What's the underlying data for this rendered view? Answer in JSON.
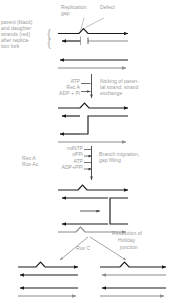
{
  "figure": {
    "width": 179,
    "height": 304,
    "background": "#ffffff"
  },
  "colors": {
    "parent_strand": "#1a1a1a",
    "daughter_strand": "#8c8c8c",
    "label_text": "#9a9a9a",
    "pointer_line": "#a8a8a8",
    "background": "#ffffff"
  },
  "labels": {
    "legend_line1": "parent (black)",
    "legend_line2": "and daughter",
    "legend_line3": "strands (red)",
    "legend_line4": "after replica-",
    "legend_line5": "tion fork",
    "replication_gap_line1": "Replication",
    "replication_gap_line2": "gap",
    "defect": "Defect",
    "step1_enzyme_atp": "ATP",
    "step1_enzyme_name": "Rec A",
    "step1_enzyme_adp": "ADP + Pi",
    "step1_result_line1": "Nicking of paren-",
    "step1_result_line2": "tal strand, strand",
    "step1_result_line3": "exchange",
    "step2_enzyme_name1": "Rec A",
    "step2_enzyme_name2": "Ruv Ac",
    "step2_sub_ndntp": "ndNTP",
    "step2_sub_nppi": "nPPi",
    "step2_sub_atp": "ATP",
    "step2_sub_adppp": "ADP+PPi",
    "step2_result_line1": "Branch migration,",
    "step2_result_line2": "gap filling",
    "step3_enzyme_name": "Ruv C",
    "step3_result_line1": "Resolution of",
    "step3_result_line2": "Holiday",
    "step3_result_line3": "junction",
    "brace_top": "{",
    "brace_bottom": "{"
  }
}
